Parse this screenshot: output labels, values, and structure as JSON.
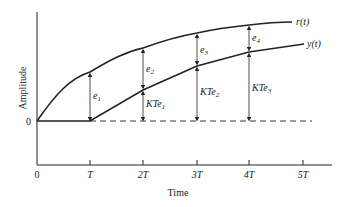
{
  "diagram": {
    "y_axis_label": "Amplitude",
    "x_axis_label": "Time",
    "origin_y_label": "0",
    "x_ticks": [
      "0",
      "T",
      "2T",
      "3T",
      "4T",
      "5T"
    ],
    "curves": [
      {
        "name": "r(t)",
        "label": "r(t)"
      },
      {
        "name": "y(t)",
        "label": "y(t)"
      }
    ],
    "errors": [
      {
        "label": "e",
        "sub": "1"
      },
      {
        "label": "e",
        "sub": "2"
      },
      {
        "label": "e",
        "sub": "3"
      },
      {
        "label": "e",
        "sub": "4"
      }
    ],
    "outputs": [
      {
        "label": "KTe",
        "sub": "1"
      },
      {
        "label": "KTe",
        "sub": "2"
      },
      {
        "label": "KTe",
        "sub": "3"
      }
    ]
  }
}
